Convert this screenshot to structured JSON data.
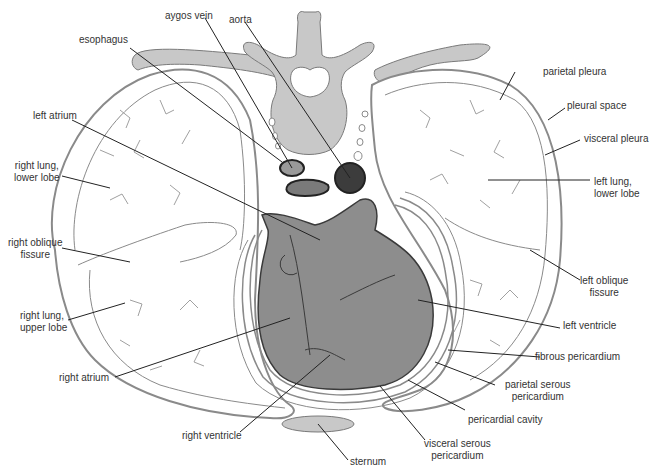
{
  "colors": {
    "bone": "#c8c8c8",
    "bone_stroke": "#7a7a7a",
    "lung_fill": "#ffffff",
    "lung_stroke": "#8a8a8a",
    "heart": "#8d8d8d",
    "heart_stroke": "#3a3a3a",
    "aorta": "#3c3c3c",
    "leader": "#222222"
  },
  "labels": {
    "aygos_vein": "aygos vein",
    "aorta": "aorta",
    "esophagus": "esophagus",
    "parietal_pleura": "parietal pleura",
    "pleural_space": "pleural space",
    "visceral_pleura": "visceral pleura",
    "left_atrium": "left atrium",
    "right_lung_lower": "right lung,\nlower lobe",
    "left_lung_lower": "left lung,\nlower lobe",
    "right_oblique": "right oblique\nfissure",
    "left_oblique": "left oblique\nfissure",
    "right_lung_upper": "right lung,\nupper lobe",
    "left_ventricle": "left ventricle",
    "fibrous_pericardium": "fibrous pericardium",
    "right_atrium": "right atrium",
    "parietal_serous": "parietal serous\npericardium",
    "pericardial_cavity": "pericardial cavity",
    "right_ventricle": "right ventricle",
    "visceral_serous": "visceral serous\npericardium",
    "sternum": "sternum"
  }
}
